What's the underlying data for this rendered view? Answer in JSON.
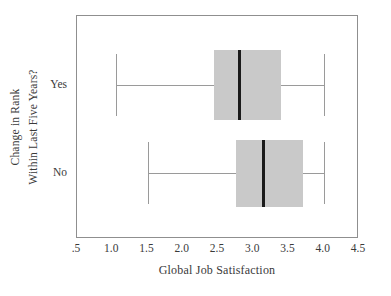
{
  "chart_data": {
    "type": "box",
    "title": "",
    "xlabel": "Global Job Satisfaction",
    "ylabel": "Change in Rank Within Last Five Years?",
    "ylabel_lines": [
      "Change in Rank",
      "Within Last Five Years?"
    ],
    "xlim": [
      0.5,
      4.5
    ],
    "xticks": [
      0.5,
      1.0,
      1.5,
      2.0,
      2.5,
      3.0,
      3.5,
      4.0,
      4.5
    ],
    "xticklabels": [
      ".5",
      "1.0",
      "1.5",
      "2.0",
      "2.5",
      "3.0",
      "3.5",
      "4.0",
      "4.5"
    ],
    "grid": false,
    "legend": false,
    "orientation": "horizontal",
    "categories": [
      "Yes",
      "No"
    ],
    "boxes": [
      {
        "category": "Yes",
        "whisker_low": 1.05,
        "q1": 2.45,
        "median": 2.8,
        "q3": 3.4,
        "whisker_high": 4.0
      },
      {
        "category": "No",
        "whisker_low": 1.5,
        "q1": 2.75,
        "median": 3.15,
        "q3": 3.7,
        "whisker_high": 4.0
      }
    ],
    "colors": {
      "box_fill": "#c9c9c9",
      "median": "#1a1a1a",
      "whisker": "#9a9a9a",
      "frame": "#8f8f8f",
      "text": "#3a3a3a",
      "background": "#ffffff"
    }
  }
}
